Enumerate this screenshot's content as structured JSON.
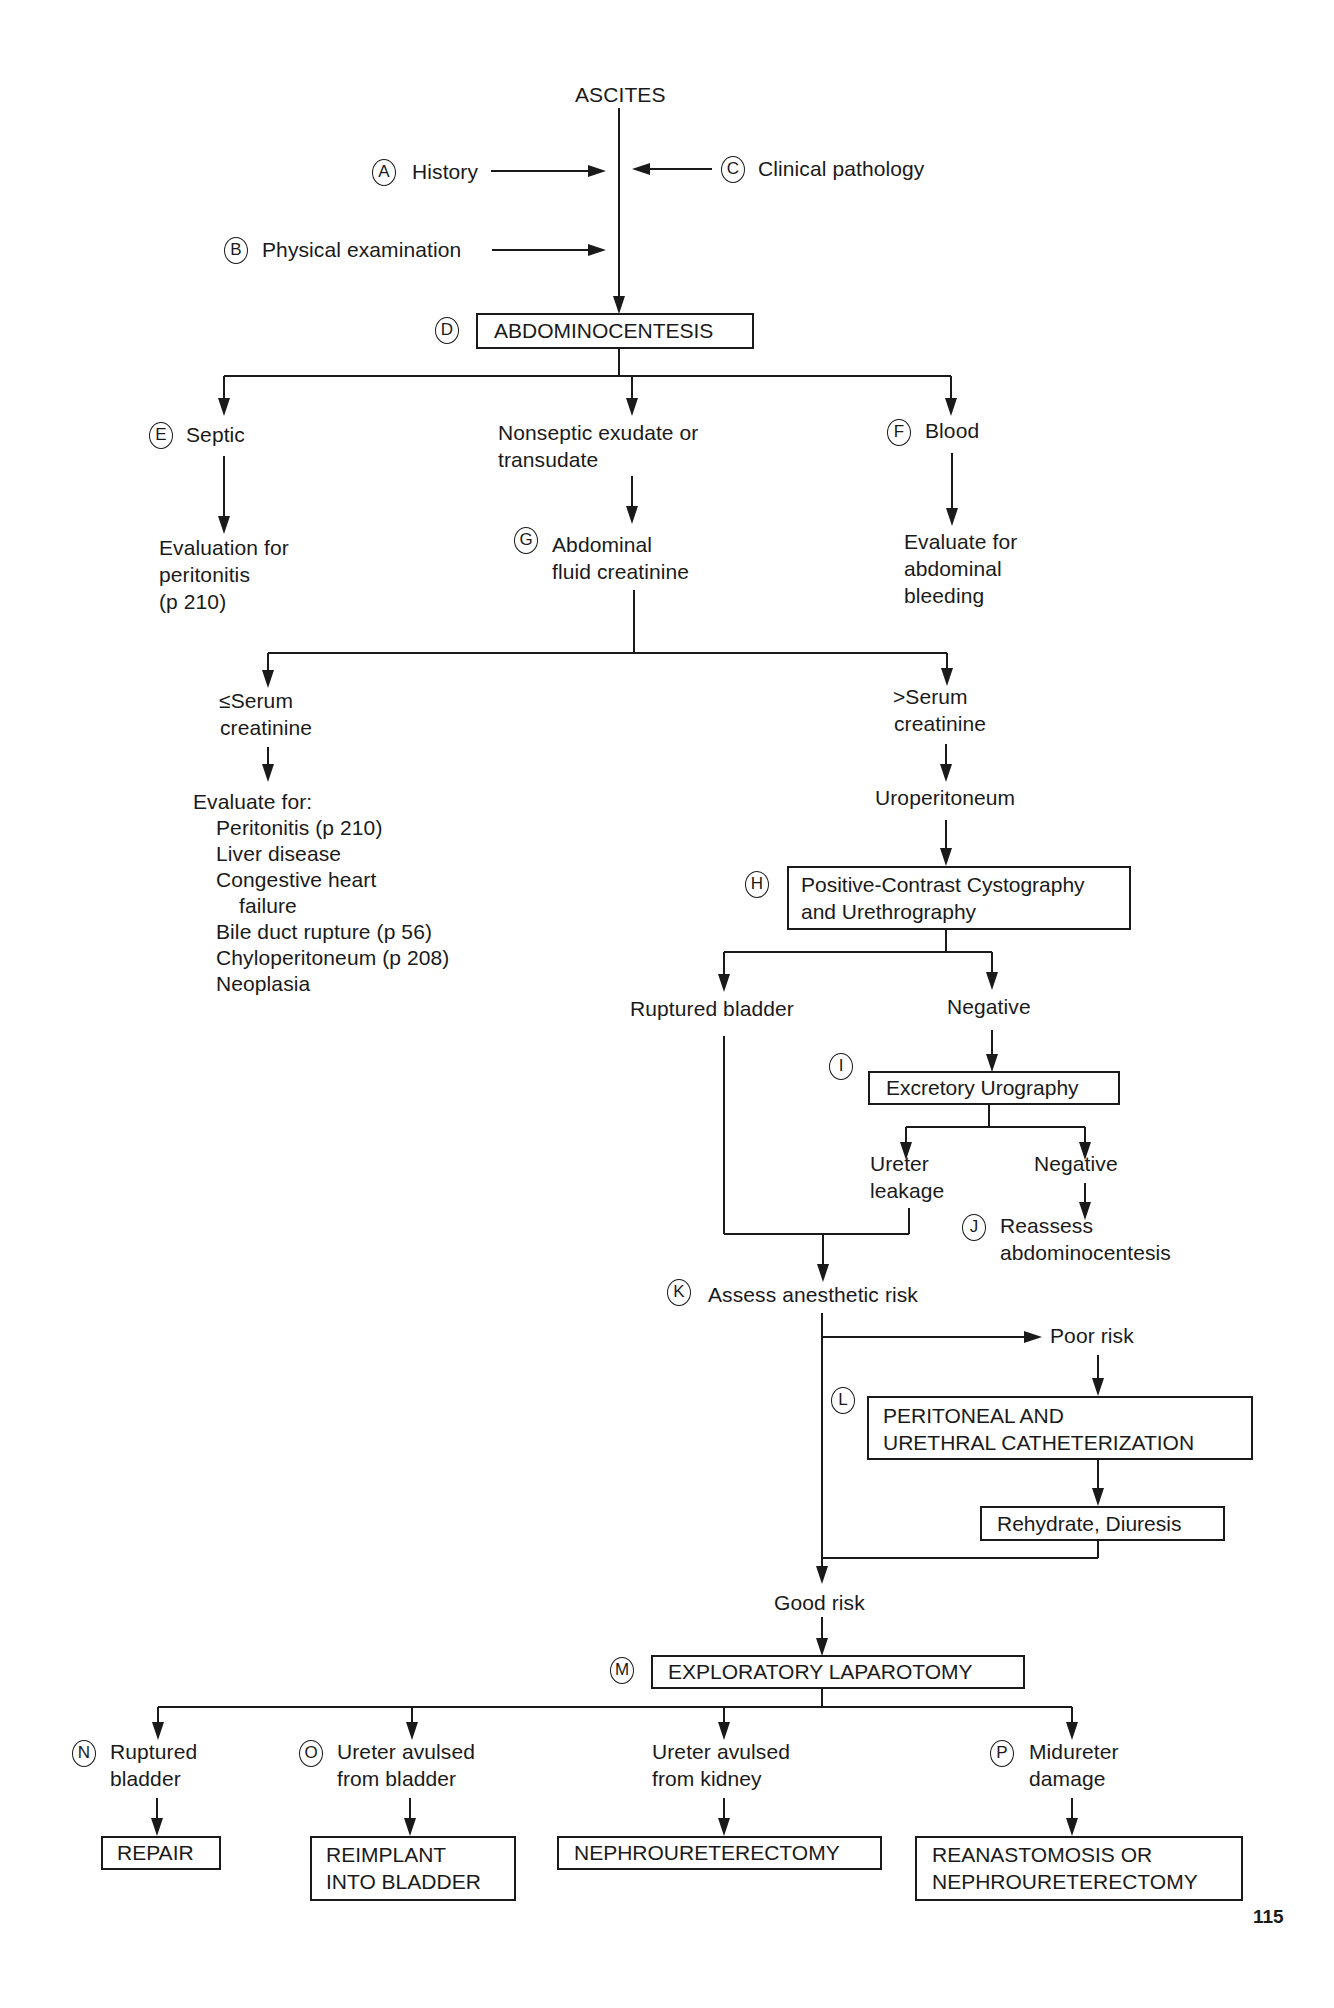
{
  "flowchart": {
    "root": "ASCITES",
    "inputs": [
      {
        "letter": "A",
        "label": "History"
      },
      {
        "letter": "B",
        "label": "Physical examination"
      },
      {
        "letter": "C",
        "label": "Clinical pathology"
      }
    ],
    "abdominocentesis": {
      "letter": "D",
      "label": "ABDOMINOCENTESIS"
    },
    "septic": {
      "letter": "E",
      "label": "Septic",
      "result": [
        "Evaluation for",
        "peritonitis",
        "(p 210)"
      ]
    },
    "nonseptic": {
      "label": [
        "Nonseptic exudate or",
        "transudate"
      ]
    },
    "blood": {
      "letter": "F",
      "label": "Blood",
      "result": [
        "Evaluate for",
        "abdominal",
        "bleeding"
      ]
    },
    "creatinine": {
      "letter": "G",
      "label": [
        "Abdominal",
        "fluid creatinine"
      ]
    },
    "le_serum": {
      "label": [
        "≤Serum",
        "creatinine"
      ],
      "evaluate_title": "Evaluate for:",
      "evaluate_items": [
        "Peritonitis (p 210)",
        "Liver disease",
        "Congestive heart",
        "failure",
        "Bile duct rupture (p 56)",
        "Chyloperitoneum (p 208)",
        "Neoplasia"
      ]
    },
    "gt_serum": {
      "label": [
        ">Serum",
        "creatinine"
      ],
      "next": "Uroperitoneum"
    },
    "cystography": {
      "letter": "H",
      "label": [
        "Positive-Contrast Cystography",
        "and Urethrography"
      ]
    },
    "ruptured_bladder": "Ruptured bladder",
    "negative_1": "Negative",
    "urography": {
      "letter": "I",
      "label": "Excretory Urography"
    },
    "ureter_leakage": [
      "Ureter",
      "leakage"
    ],
    "negative_2": "Negative",
    "reassess": {
      "letter": "J",
      "label": [
        "Reassess",
        "abdominocentesis"
      ]
    },
    "anesthetic": {
      "letter": "K",
      "label": "Assess anesthetic risk"
    },
    "poor_risk": "Poor risk",
    "catheterization": {
      "letter": "L",
      "label": [
        "PERITONEAL AND",
        "URETHRAL CATHETERIZATION"
      ]
    },
    "rehydrate": "Rehydrate, Diuresis",
    "good_risk": "Good risk",
    "laparotomy": {
      "letter": "M",
      "label": "EXPLORATORY LAPAROTOMY"
    },
    "outcomes": [
      {
        "letter": "N",
        "label": [
          "Ruptured",
          "bladder"
        ],
        "action": [
          "REPAIR"
        ]
      },
      {
        "letter": "O",
        "label": [
          "Ureter avulsed",
          "from bladder"
        ],
        "action": [
          "REIMPLANT",
          "INTO BLADDER"
        ]
      },
      {
        "letter": "",
        "label": [
          "Ureter avulsed",
          "from kidney"
        ],
        "action": [
          "NEPHROURETERECTOMY"
        ]
      },
      {
        "letter": "P",
        "label": [
          "Midureter",
          "damage"
        ],
        "action": [
          "REANASTOMOSIS OR",
          "NEPHROURETERECTOMY"
        ]
      }
    ],
    "page_number": "115"
  }
}
